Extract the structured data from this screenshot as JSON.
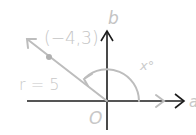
{
  "diagram": {
    "title": "",
    "axes": {
      "horizontal_label": "a",
      "vertical_label": "b",
      "origin_label": "O"
    },
    "point": {
      "label": "(−4,3)",
      "x": -4,
      "y": 3
    },
    "radius_label": "r = 5",
    "angle_label": "x°",
    "colors": {
      "axis": "#1c1c1c",
      "vector": "#bdbdbd",
      "labels": "#c4c4c4",
      "point": "#b0b0b0"
    }
  }
}
